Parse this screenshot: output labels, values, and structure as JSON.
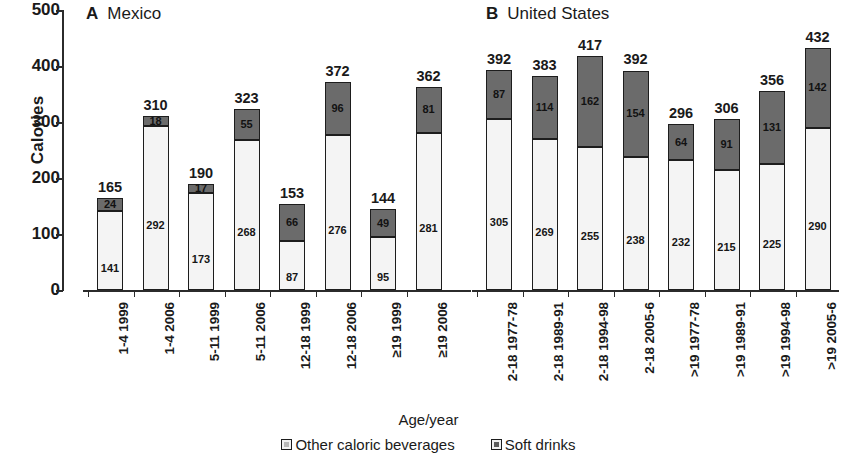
{
  "figure": {
    "axis_title": "Age/year",
    "y_axis_label": "Calories",
    "y_ticks": [
      "500",
      "400",
      "300",
      "200",
      "100",
      "0"
    ]
  },
  "legend": {
    "items": [
      {
        "label": "Other caloric beverages",
        "swatch": "light-square-icon",
        "color": "#f4f4f4"
      },
      {
        "label": "Soft drinks",
        "swatch": "dark-square-icon",
        "color": "#6b6b6b"
      }
    ]
  },
  "panels": [
    {
      "letter": "A",
      "title": "Mexico"
    },
    {
      "letter": "B",
      "title": "United States"
    }
  ],
  "chart_data": {
    "type": "bar",
    "subtype": "stacked",
    "title": "",
    "xlabel": "Age/year",
    "ylabel": "Calories",
    "ylim": [
      0,
      500
    ],
    "yticks": [
      0,
      100,
      200,
      300,
      400,
      500
    ],
    "grid": false,
    "legend_position": "bottom-center",
    "series": [
      {
        "name": "Other caloric beverages",
        "color": "#f4f4f4"
      },
      {
        "name": "Soft drinks",
        "color": "#6b6b6b"
      }
    ],
    "panels": [
      {
        "label": "A",
        "name": "Mexico",
        "categories": [
          "1-4 1999",
          "1-4 2006",
          "5-11 1999",
          "5-11 2006",
          "12-18 1999",
          "12-18 2006",
          "≥19 1999",
          "≥19 2006"
        ],
        "other_caloric_beverages": [
          141,
          292,
          173,
          268,
          87,
          276,
          95,
          281
        ],
        "soft_drinks": [
          24,
          18,
          17,
          55,
          66,
          96,
          49,
          81
        ],
        "totals": [
          165,
          310,
          190,
          323,
          153,
          372,
          144,
          362
        ]
      },
      {
        "label": "B",
        "name": "United States",
        "categories": [
          "2-18 1977-78",
          "2-18 1989-91",
          "2-18 1994-98",
          "2-18 2005-6",
          ">19 1977-78",
          ">19 1989-91",
          ">19 1994-98",
          ">19 2005-6"
        ],
        "other_caloric_beverages": [
          305,
          269,
          255,
          238,
          232,
          215,
          225,
          290
        ],
        "soft_drinks": [
          87,
          114,
          162,
          154,
          64,
          91,
          131,
          142
        ],
        "totals": [
          392,
          383,
          417,
          392,
          296,
          306,
          356,
          432
        ]
      }
    ]
  }
}
